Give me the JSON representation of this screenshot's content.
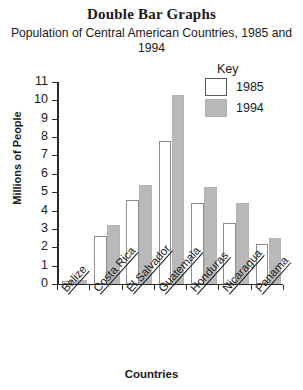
{
  "chart_data": {
    "type": "bar",
    "title": "Double Bar Graphs",
    "subtitle": "Population of Central American Countries, 1985 and 1994",
    "xlabel": "Countries",
    "ylabel": "Millions of People",
    "ylim": [
      0,
      11
    ],
    "yticks": [
      0,
      1,
      2,
      3,
      4,
      5,
      6,
      7,
      8,
      9,
      10,
      11
    ],
    "grid": false,
    "legend": {
      "title": "Key",
      "position": "top-right",
      "entries": [
        {
          "name": "1985",
          "color": "#ffffff"
        },
        {
          "name": "1994",
          "color": "#b9b9b9"
        }
      ]
    },
    "categories": [
      "Belize",
      "Costa Rica",
      "El Salvador",
      "Guatemala",
      "Honduras",
      "Nicaragua",
      "Panama"
    ],
    "series": [
      {
        "name": "1985",
        "color": "#ffffff",
        "values": [
          0.16,
          2.6,
          4.6,
          7.8,
          4.4,
          3.3,
          2.2
        ]
      },
      {
        "name": "1994",
        "color": "#b9b9b9",
        "values": [
          0.21,
          3.2,
          5.4,
          10.3,
          5.3,
          4.4,
          2.5
        ]
      }
    ]
  }
}
